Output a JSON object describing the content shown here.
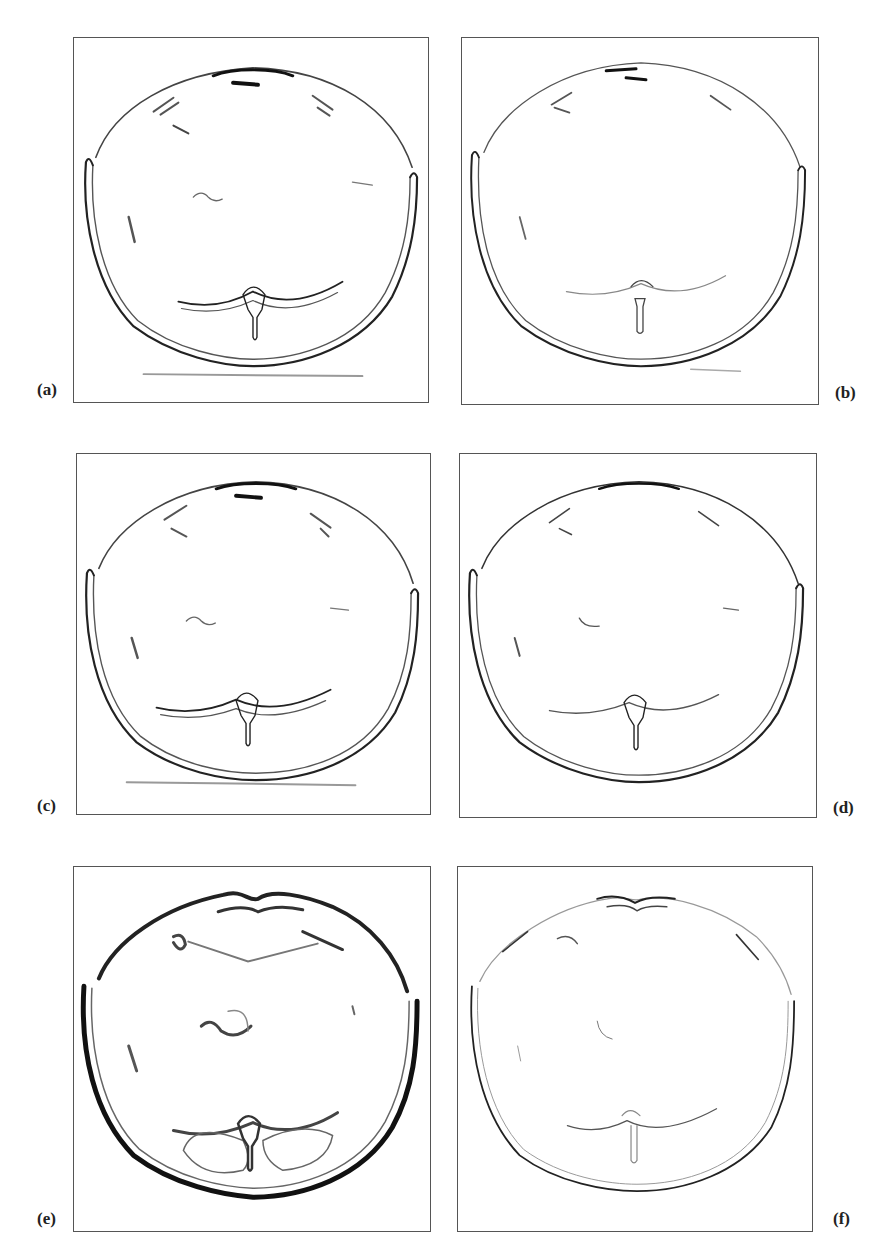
{
  "figure": {
    "panels": [
      {
        "id": "a",
        "label": "(a)",
        "style": "medium-edges",
        "has_table_line": true
      },
      {
        "id": "b",
        "label": "(b)",
        "style": "thin-edges",
        "has_table_line": true
      },
      {
        "id": "c",
        "label": "(c)",
        "style": "medium-edges",
        "has_table_line": true
      },
      {
        "id": "d",
        "label": "(d)",
        "style": "thin-edges",
        "has_table_line": false
      },
      {
        "id": "e",
        "label": "(e)",
        "style": "thick-blurred-edges",
        "has_table_line": false
      },
      {
        "id": "f",
        "label": "(f)",
        "style": "faint-thin-edges",
        "has_table_line": false
      }
    ],
    "colors": {
      "border": "#555555",
      "edge": "#222222",
      "faint_edge": "#9a9a9a",
      "background": "#ffffff"
    }
  }
}
